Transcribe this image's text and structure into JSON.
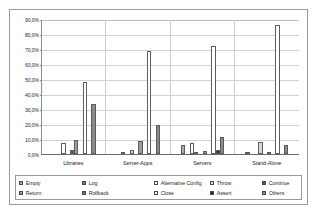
{
  "chart_data": {
    "type": "bar",
    "title": "",
    "xlabel": "",
    "ylabel": "",
    "ylim": [
      0,
      90
    ],
    "grid": true,
    "legend_position": "bottom",
    "categories": [
      "Libraries",
      "Server-Apps",
      "Servers",
      "Stand-Alone"
    ],
    "ytick_labels": [
      "90,0%",
      "80,0%",
      "70,0%",
      "60,0%",
      "50,0%",
      "40,0%",
      "30,0%",
      "20,0%",
      "10,0%",
      "0,0%"
    ],
    "ytick_values": [
      90,
      80,
      70,
      60,
      50,
      40,
      30,
      20,
      10,
      0
    ],
    "series": [
      {
        "name": "Empty",
        "swatch": "#a9a9a9",
        "values": [
          0.0,
          0.0,
          6.2,
          1.4
        ]
      },
      {
        "name": "Log",
        "swatch": "#7d7d7d",
        "values": [
          0.0,
          1.0,
          0.0,
          0.0
        ]
      },
      {
        "name": "Alternative Config",
        "swatch": "#ffffff",
        "values": [
          7.1,
          0.0,
          7.4,
          0.0
        ]
      },
      {
        "name": "Throw",
        "swatch": "#d8d8d8",
        "values": [
          0.0,
          3.0,
          0.6,
          7.9
        ]
      },
      {
        "name": "Continue",
        "swatch": "#585858",
        "values": [
          3.0,
          0.0,
          0.0,
          0.0
        ]
      },
      {
        "name": "Return",
        "swatch": "#9c9c9c",
        "values": [
          9.4,
          8.8,
          2.1,
          0.9
        ]
      },
      {
        "name": "Rollback",
        "swatch": "#6f6f6f",
        "values": [
          0.0,
          0.0,
          0.0,
          0.0
        ]
      },
      {
        "name": "Close",
        "swatch": "#ffffff",
        "values": [
          47.8,
          68.5,
          71.8,
          85.7
        ]
      },
      {
        "name": "Assert",
        "swatch": "#2a2a2a",
        "values": [
          0.0,
          0.0,
          2.8,
          0.0
        ]
      },
      {
        "name": "Others",
        "swatch": "#8a8a8a",
        "values": [
          33.6,
          19.6,
          11.2,
          5.8
        ]
      }
    ]
  },
  "legend": {
    "row1": [
      {
        "label": "Empty"
      },
      {
        "label": "Log"
      },
      {
        "label": "Alternative Config"
      },
      {
        "label": "Throw"
      },
      {
        "label": "Continue"
      }
    ],
    "row2": [
      {
        "label": "Return"
      },
      {
        "label": "Rollback"
      },
      {
        "label": "Close"
      },
      {
        "label": "Assert"
      },
      {
        "label": "Others"
      }
    ]
  }
}
